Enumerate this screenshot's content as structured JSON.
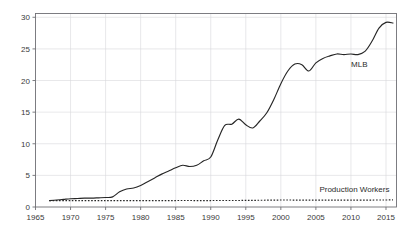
{
  "chart_data": {
    "type": "line",
    "title": "",
    "subtitle": "",
    "xlabel": "",
    "ylabel": "",
    "xlim": [
      1965,
      2016.5
    ],
    "ylim": [
      0,
      30.6
    ],
    "grid": true,
    "legend": "inline-labels",
    "xticks": [
      1965,
      1970,
      1975,
      1980,
      1985,
      1990,
      1995,
      2000,
      2005,
      2010,
      2015
    ],
    "xtick_labels": [
      "1965",
      "1970",
      "1975",
      "1980",
      "1985",
      "1990",
      "1995",
      "2000",
      "2005",
      "2010",
      "2015"
    ],
    "yticks": [
      0,
      5,
      10,
      15,
      20,
      25,
      30
    ],
    "ytick_labels": [
      "0",
      "5",
      "10",
      "15",
      "20",
      "25",
      "30"
    ],
    "series": [
      {
        "name": "MLB",
        "label": "MLB",
        "style": "solid",
        "color": "#262626",
        "label_x": 2011.2,
        "label_y": 22.2,
        "x": [
          1967,
          1968,
          1969,
          1970,
          1971,
          1972,
          1973,
          1974,
          1975,
          1976,
          1977,
          1978,
          1979,
          1980,
          1981,
          1982,
          1983,
          1984,
          1985,
          1986,
          1987,
          1988,
          1989,
          1990,
          1991,
          1992,
          1993,
          1994,
          1995,
          1996,
          1997,
          1998,
          1999,
          2000,
          2001,
          2002,
          2003,
          2004,
          2005,
          2006,
          2007,
          2008,
          2009,
          2010,
          2011,
          2012,
          2013,
          2014,
          2015,
          2016
        ],
        "y": [
          1.0,
          1.1,
          1.2,
          1.3,
          1.35,
          1.4,
          1.4,
          1.45,
          1.5,
          1.6,
          2.4,
          2.85,
          3.0,
          3.4,
          4.0,
          4.6,
          5.2,
          5.7,
          6.2,
          6.6,
          6.4,
          6.6,
          7.3,
          7.9,
          10.6,
          12.9,
          13.1,
          13.9,
          13.0,
          12.5,
          13.6,
          14.9,
          17.0,
          19.5,
          21.5,
          22.6,
          22.5,
          21.5,
          22.8,
          23.5,
          23.9,
          24.2,
          24.1,
          24.2,
          24.1,
          24.6,
          26.2,
          28.3,
          29.2,
          29.1
        ]
      },
      {
        "name": "Production Workers",
        "label": "Production Workers",
        "style": "dotted",
        "color": "#262626",
        "label_x": 2010.5,
        "label_y": 2.35,
        "x": [
          1967,
          1970,
          1975,
          1980,
          1985,
          1990,
          1995,
          2000,
          2005,
          2010,
          2016
        ],
        "y": [
          1.0,
          1.02,
          1.0,
          1.0,
          1.02,
          1.02,
          1.04,
          1.1,
          1.08,
          1.08,
          1.12
        ]
      }
    ]
  }
}
